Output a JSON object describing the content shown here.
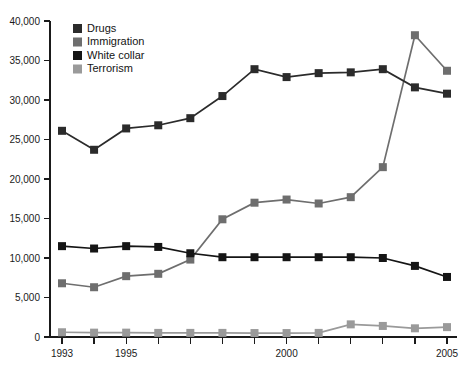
{
  "chart_data": {
    "type": "line",
    "title": "",
    "subtitle": "",
    "xlabel": "",
    "ylabel": "",
    "x": [
      1993,
      1994,
      1995,
      1996,
      1997,
      1998,
      1999,
      2000,
      2001,
      2002,
      2003,
      2004,
      2005
    ],
    "xtick_labels": [
      "1993",
      "",
      "1995",
      "",
      "",
      "",
      "",
      "2000",
      "",
      "",
      "",
      "",
      "2005"
    ],
    "ytick_labels": [
      "0",
      "5,000",
      "10,000",
      "15,000",
      "20,000",
      "25,000",
      "30,000",
      "35,000",
      "40,000"
    ],
    "ytick_values": [
      0,
      5000,
      10000,
      15000,
      20000,
      25000,
      30000,
      35000,
      40000
    ],
    "xlim": [
      1993,
      2005
    ],
    "ylim": [
      0,
      40000
    ],
    "grid": false,
    "legend_position": "top-left",
    "marker": "square",
    "series": [
      {
        "name": "Drugs",
        "color": "#2b2b2b",
        "values": [
          26100,
          23700,
          26400,
          26800,
          27700,
          30500,
          33900,
          32900,
          33400,
          33500,
          33900,
          31600,
          30800
        ]
      },
      {
        "name": "Immigration",
        "color": "#6e6e6e",
        "values": [
          6800,
          6300,
          7700,
          8000,
          9800,
          14900,
          17000,
          17400,
          16900,
          17700,
          21500,
          38200,
          33700
        ]
      },
      {
        "name": "White collar",
        "color": "#151515",
        "values": [
          11500,
          11200,
          11500,
          11400,
          10600,
          10100,
          10100,
          10100,
          10100,
          10100,
          10000,
          9000,
          7600
        ]
      },
      {
        "name": "Terrorism",
        "color": "#9a9a9a",
        "values": [
          600,
          550,
          550,
          520,
          520,
          520,
          500,
          500,
          520,
          1600,
          1400,
          1100,
          1250
        ]
      }
    ]
  }
}
